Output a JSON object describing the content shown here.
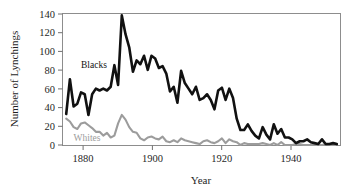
{
  "figure": {
    "background_color": "#ffffff",
    "frame_color": "#8d8d8d",
    "xlabel": "Year",
    "ylabel": "Number of Lynchings"
  },
  "labels": {
    "blacks_inline": "Blacks",
    "whites_inline": "Whites"
  },
  "chart_data": {
    "type": "line",
    "title": "",
    "xlabel": "Year",
    "ylabel": "Number of Lynchings",
    "xlim": [
      1876,
      1951
    ],
    "ylim": [
      0,
      140
    ],
    "xticks": [
      1880,
      1900,
      1920,
      1940
    ],
    "xtick_labels": [
      "1880",
      "1900",
      "1920",
      "1940"
    ],
    "yticks": [
      0,
      20,
      40,
      60,
      80,
      100,
      120,
      140
    ],
    "ytick_labels": [
      "0",
      "20",
      "40",
      "60",
      "80",
      "100",
      "120",
      "140"
    ],
    "grid": false,
    "legend": "inline-annotations",
    "colors": {
      "blacks": "#111111",
      "whites": "#9c9c9c"
    },
    "x": [
      1877,
      1878,
      1879,
      1880,
      1881,
      1882,
      1883,
      1884,
      1885,
      1886,
      1887,
      1888,
      1889,
      1890,
      1891,
      1892,
      1893,
      1894,
      1895,
      1896,
      1897,
      1898,
      1899,
      1900,
      1901,
      1902,
      1903,
      1904,
      1905,
      1906,
      1907,
      1908,
      1909,
      1910,
      1911,
      1912,
      1913,
      1914,
      1915,
      1916,
      1917,
      1918,
      1919,
      1920,
      1921,
      1922,
      1923,
      1924,
      1925,
      1926,
      1927,
      1928,
      1929,
      1930,
      1931,
      1932,
      1933,
      1934,
      1935,
      1936,
      1937,
      1938,
      1939,
      1940,
      1941,
      1942,
      1943,
      1944,
      1945,
      1946,
      1947,
      1948,
      1949,
      1950
    ],
    "series": [
      {
        "name": "Blacks",
        "color": "#111111",
        "label_position": {
          "x": 1881,
          "y": 82
        },
        "values": [
          33,
          70,
          41,
          44,
          56,
          54,
          32,
          54,
          60,
          58,
          60,
          58,
          62,
          85,
          64,
          138,
          118,
          104,
          78,
          90,
          86,
          95,
          80,
          95,
          92,
          82,
          84,
          76,
          57,
          62,
          45,
          79,
          66,
          60,
          54,
          62,
          48,
          50,
          54,
          48,
          38,
          58,
          61,
          48,
          60,
          50,
          28,
          16,
          16,
          22,
          15,
          10,
          7,
          19,
          11,
          6,
          22,
          12,
          17,
          8,
          8,
          6,
          2,
          4,
          4,
          6,
          3,
          2,
          1,
          6,
          1,
          1,
          2,
          1
        ]
      },
      {
        "name": "Whites",
        "color": "#9c9c9c",
        "label_position": {
          "x": 1879,
          "y": 4
        },
        "values": [
          28,
          25,
          19,
          17,
          23,
          24,
          21,
          18,
          14,
          14,
          10,
          13,
          8,
          10,
          23,
          32,
          27,
          19,
          14,
          13,
          7,
          5,
          8,
          9,
          7,
          6,
          9,
          4,
          3,
          5,
          3,
          7,
          5,
          4,
          3,
          2,
          1,
          4,
          5,
          3,
          2,
          4,
          7,
          2,
          6,
          4,
          3,
          0,
          2,
          1,
          1,
          1,
          1,
          2,
          1,
          0,
          2,
          0,
          3,
          0,
          0,
          0,
          1,
          1,
          0,
          0,
          0,
          0,
          0,
          0,
          1,
          0,
          0,
          0
        ]
      }
    ]
  }
}
